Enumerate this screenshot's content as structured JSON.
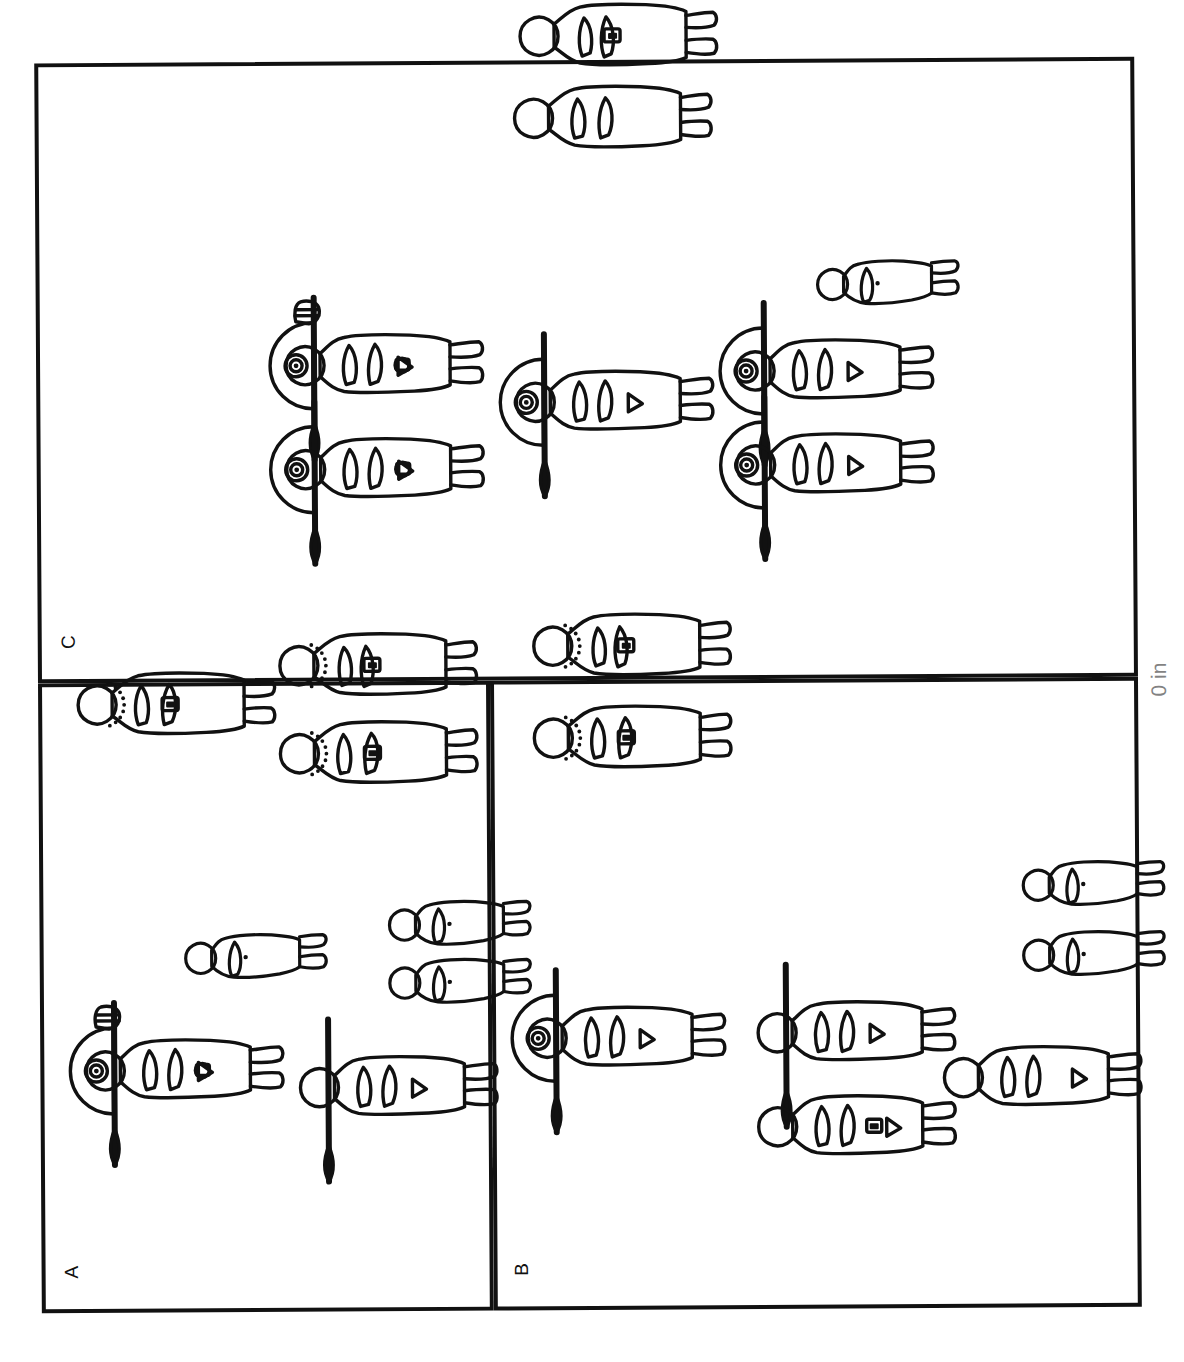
{
  "figure": {
    "orientation": "rotated-90-ccw",
    "background_color": "#ffffff",
    "ink_color": "#111111",
    "panel_count": 3,
    "caption_fragment": "0 in"
  },
  "panels": [
    {
      "id": "panel-c",
      "label": "C",
      "position": "top",
      "figure_count": 8,
      "description": "Two warriors with round shields and spears at left, one warrior with shield and spear at centre, two warriors with shields and spears at right, two robed standing persons at top, one small child figure"
    },
    {
      "id": "panel-a",
      "label": "A",
      "position": "bottom-left",
      "figure_count": 7,
      "description": "One warrior with round shield, spear and vessel at bottom left, one spear-bearer at bottom right, three robed persons with beaded necklaces at top, three small child figures at centre"
    },
    {
      "id": "panel-b",
      "label": "B",
      "position": "bottom-right",
      "figure_count": 8,
      "description": "One warrior with round shield and spear at bottom left, one spear-bearer and one plain standing person at bottom centre, one standing person at bottom right, two robed persons with beaded necklaces at top, two small child figures at right"
    }
  ],
  "figures": [
    {
      "name": "robed-person-1",
      "panel": "panel-c",
      "type": "robed-person",
      "x": 512,
      "y": 96,
      "scale": 1.0,
      "variant": "arms-folded",
      "necklace": false,
      "pendant": true,
      "shield": false,
      "spear": false
    },
    {
      "name": "robed-person-2",
      "panel": "panel-c",
      "type": "robed-person",
      "x": 506,
      "y": 178,
      "scale": 1.0,
      "variant": "arms-down",
      "necklace": false,
      "pendant": false,
      "shield": false,
      "spear": false
    },
    {
      "name": "child-1",
      "panel": "panel-c",
      "type": "child",
      "x": 806,
      "y": 328,
      "scale": 1.0,
      "variant": "plain",
      "necklace": false,
      "pendant": false,
      "shield": false,
      "spear": false
    },
    {
      "name": "warrior-1",
      "panel": "panel-c",
      "type": "warrior",
      "x": 276,
      "y": 424,
      "scale": 1.0,
      "variant": "with-vessel",
      "necklace": false,
      "pendant": true,
      "shield": true,
      "spear": true
    },
    {
      "name": "warrior-2",
      "panel": "panel-c",
      "type": "warrior",
      "x": 276,
      "y": 528,
      "scale": 1.0,
      "variant": "plain",
      "necklace": false,
      "pendant": true,
      "shield": true,
      "spear": true
    },
    {
      "name": "warrior-3",
      "panel": "panel-c",
      "type": "warrior",
      "x": 506,
      "y": 462,
      "scale": 1.0,
      "variant": "plain",
      "necklace": false,
      "pendant": false,
      "shield": true,
      "spear": true
    },
    {
      "name": "warrior-4",
      "panel": "panel-c",
      "type": "warrior",
      "x": 726,
      "y": 432,
      "scale": 1.0,
      "variant": "plain",
      "necklace": false,
      "pendant": false,
      "shield": true,
      "spear": true
    },
    {
      "name": "warrior-5",
      "panel": "panel-c",
      "type": "warrior",
      "x": 726,
      "y": 526,
      "scale": 1.0,
      "variant": "plain",
      "necklace": false,
      "pendant": false,
      "shield": true,
      "spear": true
    },
    {
      "name": "robed-person-3",
      "panel": "panel-a",
      "type": "robed-person",
      "x": 66,
      "y": 762,
      "scale": 1.0,
      "variant": "arms-down",
      "necklace": true,
      "pendant": true,
      "shield": false,
      "spear": false
    },
    {
      "name": "robed-person-4",
      "panel": "panel-a",
      "type": "robed-person",
      "x": 268,
      "y": 724,
      "scale": 1.0,
      "variant": "arms-folded",
      "necklace": true,
      "pendant": true,
      "shield": false,
      "spear": false
    },
    {
      "name": "robed-person-5",
      "panel": "panel-a",
      "type": "robed-person",
      "x": 268,
      "y": 812,
      "scale": 1.0,
      "variant": "arms-down",
      "necklace": true,
      "pendant": true,
      "shield": false,
      "spear": false
    },
    {
      "name": "child-2",
      "panel": "panel-a",
      "type": "child",
      "x": 170,
      "y": 998,
      "scale": 1.0,
      "variant": "plain",
      "necklace": false,
      "pendant": false,
      "shield": false,
      "spear": false
    },
    {
      "name": "child-3",
      "panel": "panel-a",
      "type": "child",
      "x": 374,
      "y": 966,
      "scale": 1.0,
      "variant": "plain",
      "necklace": false,
      "pendant": false,
      "shield": false,
      "spear": false
    },
    {
      "name": "child-4",
      "panel": "panel-a",
      "type": "child",
      "x": 374,
      "y": 1024,
      "scale": 1.0,
      "variant": "plain",
      "necklace": false,
      "pendant": false,
      "shield": false,
      "spear": false
    },
    {
      "name": "warrior-6",
      "panel": "panel-a",
      "type": "warrior",
      "x": 72,
      "y": 1128,
      "scale": 1.0,
      "variant": "with-vessel",
      "necklace": false,
      "pendant": true,
      "shield": true,
      "spear": true
    },
    {
      "name": "spear-bearer-1",
      "panel": "panel-a",
      "type": "spear-bearer",
      "x": 286,
      "y": 1146,
      "scale": 1.0,
      "variant": "plain",
      "necklace": false,
      "pendant": false,
      "shield": false,
      "spear": true
    },
    {
      "name": "robed-person-6",
      "panel": "panel-b",
      "type": "robed-person",
      "x": 522,
      "y": 706,
      "scale": 1.0,
      "variant": "arms-folded",
      "necklace": true,
      "pendant": true,
      "shield": false,
      "spear": false
    },
    {
      "name": "robed-person-7",
      "panel": "panel-b",
      "type": "robed-person",
      "x": 522,
      "y": 798,
      "scale": 1.0,
      "variant": "arms-down",
      "necklace": true,
      "pendant": true,
      "shield": false,
      "spear": false
    },
    {
      "name": "child-5",
      "panel": "panel-b",
      "type": "child",
      "x": 1008,
      "y": 930,
      "scale": 1.0,
      "variant": "plain",
      "necklace": false,
      "pendant": false,
      "shield": false,
      "spear": false
    },
    {
      "name": "child-6",
      "panel": "panel-b",
      "type": "child",
      "x": 1008,
      "y": 1000,
      "scale": 1.0,
      "variant": "plain",
      "necklace": false,
      "pendant": false,
      "shield": false,
      "spear": false
    },
    {
      "name": "warrior-7",
      "panel": "panel-b",
      "type": "warrior",
      "x": 514,
      "y": 1098,
      "scale": 1.0,
      "variant": "plain",
      "necklace": false,
      "pendant": false,
      "shield": true,
      "spear": true
    },
    {
      "name": "spear-bearer-2",
      "panel": "panel-b",
      "type": "spear-bearer",
      "x": 744,
      "y": 1094,
      "scale": 1.0,
      "variant": "plain",
      "necklace": false,
      "pendant": false,
      "shield": false,
      "spear": true
    },
    {
      "name": "plain-person-1",
      "panel": "panel-b",
      "type": "plain-person",
      "x": 744,
      "y": 1188,
      "scale": 1.0,
      "variant": "plain",
      "necklace": false,
      "pendant": true,
      "shield": false,
      "spear": false
    },
    {
      "name": "plain-person-2",
      "panel": "panel-b",
      "type": "plain-person",
      "x": 930,
      "y": 1140,
      "scale": 1.0,
      "variant": "plain",
      "necklace": false,
      "pendant": false,
      "shield": false,
      "spear": false
    }
  ]
}
